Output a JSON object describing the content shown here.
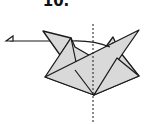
{
  "diagram": {
    "step_label": "10.",
    "colors": {
      "paper": "#d9d9d9",
      "line": "#1a1a1a",
      "background": "#ffffff"
    },
    "elements": [
      {
        "type": "arrow",
        "direction": "left",
        "meaning": "fold flap to the left"
      },
      {
        "type": "dashed-line",
        "orientation": "vertical",
        "meaning": "center fold line"
      },
      {
        "type": "paper-model",
        "meaning": "folded paper model"
      }
    ]
  }
}
